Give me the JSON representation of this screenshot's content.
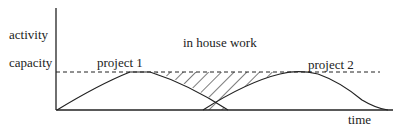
{
  "diagram": {
    "y_axis_label": "activity",
    "capacity_label": "capacity",
    "x_axis_label": "time",
    "region_label": "in house work",
    "curves": [
      {
        "label": "project 1"
      },
      {
        "label": "project 2"
      }
    ],
    "colors": {
      "line": "#222222",
      "background": "#ffffff"
    }
  }
}
